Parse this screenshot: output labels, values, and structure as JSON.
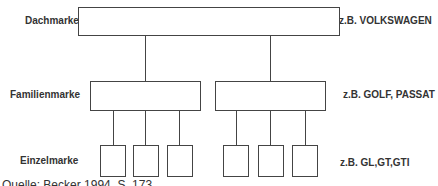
{
  "diagram": {
    "levels": [
      {
        "name": "Dachmarke",
        "example": "z.B. VOLKSWAGEN"
      },
      {
        "name": "Familienmarke",
        "example": "z.B. GOLF, PASSAT"
      },
      {
        "name": "Einzelmarke",
        "example": "z.B. GL,GT,GTI"
      }
    ],
    "structure": {
      "root": "Dachmarke",
      "families": 2,
      "individual_per_family": 3
    },
    "source": "Quelle: Becker 1994, S. 173"
  }
}
